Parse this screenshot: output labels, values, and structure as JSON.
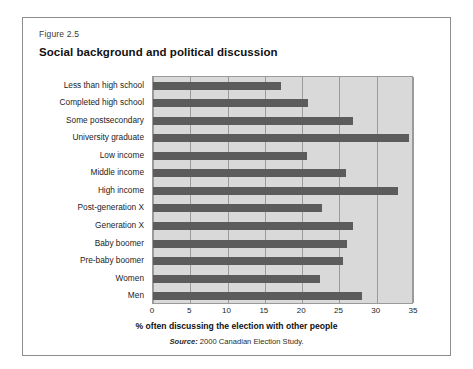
{
  "figure": {
    "number": "Figure 2.5",
    "title": "Social background and political discussion",
    "source_word": "Source:",
    "source_text": " 2000 Canadian Election Study."
  },
  "colors": {
    "bar": "#5c5c5c",
    "plot_background": "#d9d9d9",
    "gridline": "#9b9b9b",
    "frame_border": "#8d8d8d",
    "text": "#1d1d1d"
  },
  "chart_data": {
    "type": "bar",
    "orientation": "horizontal",
    "title": "Social background and political discussion",
    "subtitle": "Figure 2.5",
    "xlabel": "% often discussing the election with other people",
    "ylabel": "",
    "xlim": [
      0,
      35
    ],
    "xticks": [
      0,
      5,
      10,
      15,
      20,
      25,
      30,
      35
    ],
    "xtick_labels": [
      "0",
      "5",
      "10",
      "15",
      "20",
      "25",
      "30",
      "35"
    ],
    "grid": true,
    "legend": null,
    "source": "Source: 2000 Canadian Election Study.",
    "categories": [
      "Less than high school",
      "Completed high school",
      "Some postsecondary",
      "University graduate",
      "Low income",
      "Middle income",
      "High income",
      "Post-generation X",
      "Generation X",
      "Baby boomer",
      "Pre-baby boomer",
      "Women",
      "Men"
    ],
    "values": [
      17.2,
      20.8,
      26.8,
      34.3,
      20.7,
      25.9,
      32.8,
      22.7,
      26.8,
      26.0,
      25.5,
      22.4,
      28.0
    ]
  }
}
